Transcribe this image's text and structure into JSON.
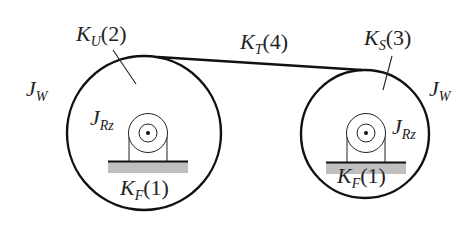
{
  "diagram": {
    "type": "belt-drive-stiffness-model",
    "colors": {
      "line": "#111111",
      "base_fill": "#bfbfbf",
      "text": "#222222"
    },
    "labels": {
      "ku": {
        "sym": "K",
        "sub": "U",
        "num": "(2)"
      },
      "kt": {
        "sym": "K",
        "sub": "T",
        "num": "(4)"
      },
      "ks": {
        "sym": "K",
        "sub": "S",
        "num": "(3)"
      },
      "jw_left": {
        "sym": "J",
        "sub": "W"
      },
      "jw_right": {
        "sym": "J",
        "sub": "W"
      },
      "jrz_left": {
        "sym": "J",
        "sub": "Rz"
      },
      "jrz_right": {
        "sym": "J",
        "sub": "Rz"
      },
      "kf_left": {
        "sym": "K",
        "sub": "F",
        "num": "(1)"
      },
      "kf_right": {
        "sym": "K",
        "sub": "F",
        "num": "(1)"
      }
    },
    "wheels": [
      {
        "name": "left-wheel",
        "cx": 144,
        "cy": 133,
        "r": 77
      },
      {
        "name": "right-wheel",
        "cx": 365,
        "cy": 134,
        "r": 64
      }
    ]
  }
}
